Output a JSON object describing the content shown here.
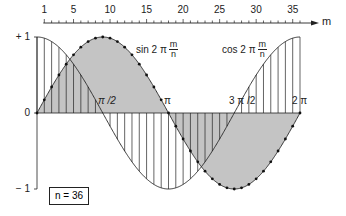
{
  "chart_data": {
    "type": "line",
    "title": "",
    "xlabel": "m",
    "ylabel": "",
    "n": 36,
    "x_top_ticks": [
      1,
      5,
      10,
      15,
      20,
      25,
      30,
      35
    ],
    "x_top_minor_step": 1,
    "x_range": [
      0,
      36
    ],
    "ylim": [
      -1,
      1
    ],
    "y_tick_labels": [
      "+ 1",
      "0",
      "− 1"
    ],
    "y_tick_values": [
      1,
      0,
      -1
    ],
    "phase_labels": [
      {
        "text": "π /2",
        "m": 9
      },
      {
        "text": "π",
        "m": 18
      },
      {
        "text": "3 π /2",
        "m": 27
      },
      {
        "text": "2 π",
        "m": 36
      }
    ],
    "series": [
      {
        "name": "sin 2π m/n",
        "function": "sin",
        "style": "gray-fill-with-dots",
        "fill": "#c4c4c4",
        "x": [
          0,
          1,
          2,
          3,
          4,
          5,
          6,
          7,
          8,
          9,
          10,
          11,
          12,
          13,
          14,
          15,
          16,
          17,
          18,
          19,
          20,
          21,
          22,
          23,
          24,
          25,
          26,
          27,
          28,
          29,
          30,
          31,
          32,
          33,
          34,
          35,
          36
        ],
        "values": [
          0,
          0.174,
          0.342,
          0.5,
          0.643,
          0.766,
          0.866,
          0.94,
          0.985,
          1,
          0.985,
          0.94,
          0.866,
          0.766,
          0.643,
          0.5,
          0.342,
          0.174,
          0,
          -0.174,
          -0.342,
          -0.5,
          -0.643,
          -0.766,
          -0.866,
          -0.94,
          -0.985,
          -1,
          -0.985,
          -0.94,
          -0.866,
          -0.766,
          -0.643,
          -0.5,
          -0.342,
          -0.174,
          0
        ]
      },
      {
        "name": "cos 2π m/n",
        "function": "cos",
        "style": "vertical-hatch",
        "x": [
          0,
          1,
          2,
          3,
          4,
          5,
          6,
          7,
          8,
          9,
          10,
          11,
          12,
          13,
          14,
          15,
          16,
          17,
          18,
          19,
          20,
          21,
          22,
          23,
          24,
          25,
          26,
          27,
          28,
          29,
          30,
          31,
          32,
          33,
          34,
          35,
          36
        ],
        "values": [
          1,
          0.985,
          0.94,
          0.866,
          0.766,
          0.643,
          0.5,
          0.342,
          0.174,
          0,
          -0.174,
          -0.342,
          -0.5,
          -0.643,
          -0.766,
          -0.866,
          -0.94,
          -0.985,
          -1,
          -0.985,
          -0.94,
          -0.866,
          -0.766,
          -0.643,
          -0.5,
          -0.342,
          -0.174,
          0,
          0.174,
          0.342,
          0.5,
          0.643,
          0.766,
          0.866,
          0.94,
          0.985,
          1
        ]
      }
    ]
  },
  "labels": {
    "axis_m": "m",
    "sin_prefix": "sin 2 π",
    "cos_prefix": "cos 2 π",
    "frac_num": "m",
    "frac_den": "n",
    "n_box": "n = 36",
    "y_plus1": "+ 1",
    "y_zero": "0",
    "y_minus1": "− 1",
    "pi_half": "π /2",
    "pi": "π",
    "three_pi_half": "3 π /2",
    "two_pi": "2 π"
  },
  "colors": {
    "fill": "#c4c4c4",
    "stroke": "#222222"
  }
}
